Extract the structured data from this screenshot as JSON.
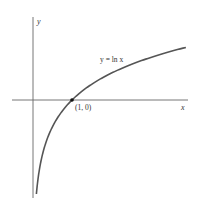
{
  "chart_data": {
    "type": "line",
    "title": "",
    "xlabel": "x",
    "ylabel": "y",
    "curve_label": "y = ln x",
    "point_label": "(1, 0)",
    "series": [
      {
        "name": "y = ln x",
        "function": "ln(x)",
        "x_range": [
          0.087,
          3.92
        ]
      }
    ],
    "marked_point": {
      "x": 1,
      "y": 0
    },
    "xlim": [
      -0.55,
      3.97
    ],
    "ylim": [
      -2.5,
      2.15
    ],
    "grid": false,
    "colors": {
      "curve": "#555555",
      "axis": "#666666",
      "point": "#111111"
    }
  }
}
